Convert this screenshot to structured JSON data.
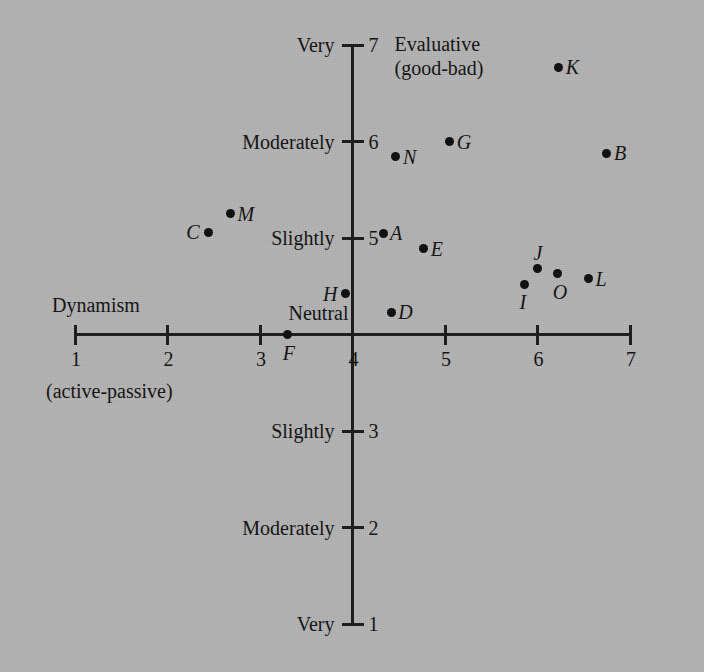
{
  "figure": {
    "background_color": "#b3b3b3",
    "ink_color": "#111111",
    "quadrant_note_line1": "Evaluative",
    "quadrant_note_line2": "(good-bad)",
    "x_axis_title": "Dynamism",
    "x_axis_subtitle": "(active-passive)"
  },
  "chart_data": {
    "type": "scatter",
    "title": "",
    "xlabel": "Dynamism (active-passive)",
    "ylabel": "Evaluative (good-bad)",
    "xlim": [
      1,
      7
    ],
    "ylim": [
      1,
      7
    ],
    "grid": false,
    "legend": "none",
    "x_ticks": [
      1,
      2,
      3,
      4,
      5,
      6,
      7
    ],
    "x_tick_labels": [
      "1",
      "2",
      "3",
      "4",
      "5",
      "6",
      "7"
    ],
    "y_ticks": [
      1,
      2,
      3,
      4,
      5,
      6,
      7
    ],
    "y_tick_labels": [
      "1",
      "2",
      "3",
      "4",
      "5",
      "6",
      "7"
    ],
    "y_category_labels": [
      {
        "value": 7,
        "label": "Very"
      },
      {
        "value": 6,
        "label": "Moderately"
      },
      {
        "value": 5,
        "label": "Slightly"
      },
      {
        "value": 4,
        "label": "Neutral"
      },
      {
        "value": 3,
        "label": "Slightly"
      },
      {
        "value": 2,
        "label": "Moderately"
      },
      {
        "value": 1,
        "label": "Very"
      }
    ],
    "points": [
      {
        "label": "K",
        "x": 6.23,
        "y": 6.77,
        "label_pos": "right"
      },
      {
        "label": "B",
        "x": 6.75,
        "y": 5.88,
        "label_pos": "right"
      },
      {
        "label": "G",
        "x": 5.05,
        "y": 6.0,
        "label_pos": "right"
      },
      {
        "label": "N",
        "x": 4.47,
        "y": 5.84,
        "label_pos": "right"
      },
      {
        "label": "M",
        "x": 2.68,
        "y": 5.25,
        "label_pos": "right"
      },
      {
        "label": "C",
        "x": 2.44,
        "y": 5.06,
        "label_pos": "left"
      },
      {
        "label": "A",
        "x": 4.33,
        "y": 5.05,
        "label_pos": "right"
      },
      {
        "label": "E",
        "x": 4.77,
        "y": 4.89,
        "label_pos": "right"
      },
      {
        "label": "J",
        "x": 6.0,
        "y": 4.68,
        "label_pos": "above"
      },
      {
        "label": "O",
        "x": 6.22,
        "y": 4.63,
        "label_pos": "below"
      },
      {
        "label": "L",
        "x": 6.55,
        "y": 4.58,
        "label_pos": "right"
      },
      {
        "label": "I",
        "x": 5.86,
        "y": 4.52,
        "label_pos": "below"
      },
      {
        "label": "H",
        "x": 3.92,
        "y": 4.42,
        "label_pos": "left"
      },
      {
        "label": "D",
        "x": 4.42,
        "y": 4.23,
        "label_pos": "right"
      },
      {
        "label": "F",
        "x": 3.3,
        "y": 4.0,
        "label_pos": "below"
      }
    ]
  }
}
